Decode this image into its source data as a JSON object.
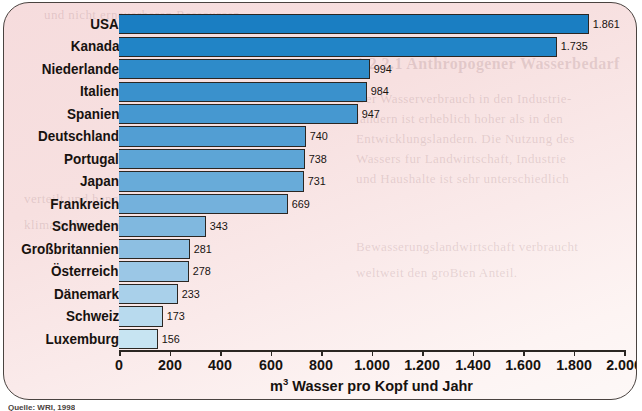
{
  "panel": {
    "background_color": "#f7e0e0",
    "border_color": "#4a4340"
  },
  "source_caption": "Quelle: WRI, 1998",
  "bleed_text": [
    "und nicht erneuerbaren Ressourcen",
    "1.2.2.1  Anthropogener Wasserbedarf",
    "Der Wasserverbrauch in den Industrie-",
    "landern ist erheblich hoher als in den",
    "Entwicklungslandern. Die Nutzung des",
    "Wassers fur Landwirtschaft, Industrie",
    "und Haushalte ist sehr unterschiedlich",
    "verteilt und hangt stark von den",
    "klimatischen Bedingungen ab.",
    "Bewasserungslandwirtschaft verbraucht",
    "weltweit den groBten Anteil."
  ],
  "chart_data": {
    "type": "bar",
    "orientation": "horizontal",
    "title": "",
    "xlabel": "m³ Wasser pro Kopf und Jahr",
    "ylabel": "",
    "xlim": [
      0,
      2000
    ],
    "grid": false,
    "legend": false,
    "tick_step": 200,
    "tick_labels": [
      "0",
      "200",
      "400",
      "600",
      "800",
      "1.000",
      "1.200",
      "1.400",
      "1.600",
      "1.800",
      "2.000"
    ],
    "tick_values": [
      0,
      200,
      400,
      600,
      800,
      1000,
      1200,
      1400,
      1600,
      1800,
      2000
    ],
    "categories": [
      "USA",
      "Kanada",
      "Niederlande",
      "Italien",
      "Spanien",
      "Deutschland",
      "Portugal",
      "Japan",
      "Frankreich",
      "Schweden",
      "Großbritannien",
      "Österreich",
      "Dänemark",
      "Schweiz",
      "Luxemburg"
    ],
    "values": [
      1861,
      1735,
      994,
      984,
      947,
      740,
      738,
      731,
      669,
      343,
      281,
      278,
      233,
      173,
      156
    ],
    "value_labels": [
      "1.861",
      "1.735",
      "994",
      "984",
      "947",
      "740",
      "738",
      "731",
      "669",
      "343",
      "281",
      "278",
      "233",
      "173",
      "156"
    ],
    "bar_colors": [
      "#1a7ec2",
      "#2184c6",
      "#2e8bc9",
      "#3a91cc",
      "#4698d0",
      "#529ed3",
      "#5da5d6",
      "#68abd9",
      "#74b1dc",
      "#80b8df",
      "#8dbfe2",
      "#9bc7e6",
      "#a9d0ea",
      "#b8daee",
      "#c7e4f2"
    ]
  }
}
